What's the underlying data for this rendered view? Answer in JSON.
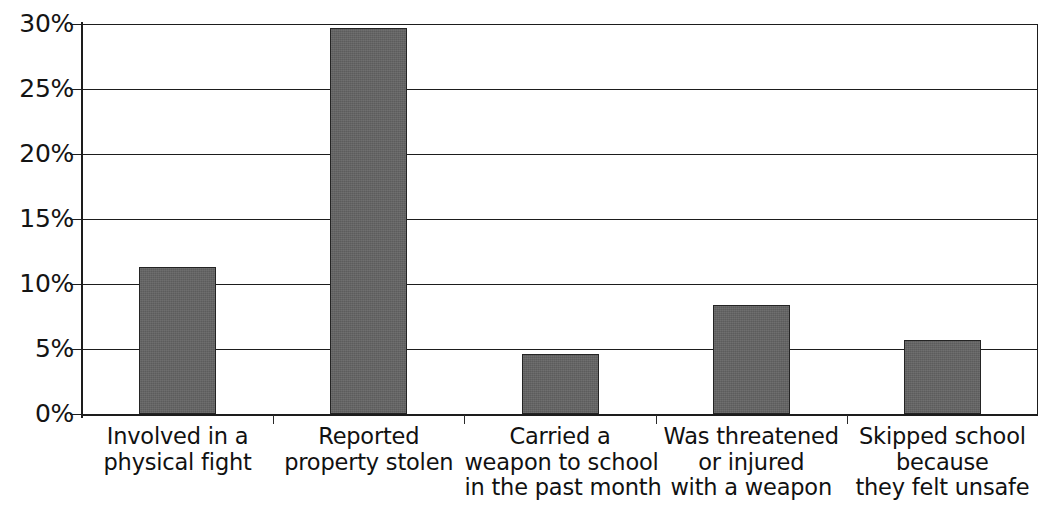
{
  "chart_data": {
    "type": "bar",
    "title": "",
    "subtitle": "",
    "xlabel": "",
    "ylabel": "",
    "categories": [
      "Involved in a physical fight",
      "Reported property stolen",
      "Carried a weapon to school in the past month",
      "Was threatened or injured with a weapon",
      "Skipped school because they felt unsafe"
    ],
    "category_lines": [
      [
        "Involved in a",
        "physical fight"
      ],
      [
        "Reported",
        "property stolen"
      ],
      [
        "Carried a",
        "weapon to school",
        "in the past month"
      ],
      [
        "Was threatened",
        "or injured",
        "with a weapon"
      ],
      [
        "Skipped school",
        "because",
        "they felt unsafe"
      ]
    ],
    "values": [
      11.3,
      29.7,
      4.6,
      8.4,
      5.7
    ],
    "value_unit": "%",
    "ylim": [
      0,
      30
    ],
    "ytick_values": [
      0,
      5,
      10,
      15,
      20,
      25,
      30
    ],
    "ytick_labels": [
      "0%",
      "5%",
      "10%",
      "15%",
      "20%",
      "25%",
      "30%"
    ],
    "grid": "horizontal",
    "legend": "none",
    "bar_color": "#636363",
    "bar_border_color": "#242424",
    "axis_color": "#1d1d1d",
    "background_color": "#ffffff"
  }
}
